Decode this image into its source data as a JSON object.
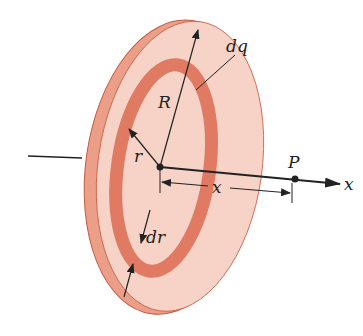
{
  "diagram": {
    "labels": {
      "charge_element": "dq",
      "disk_radius": "R",
      "ring_radius": "r",
      "point": "P",
      "axis": "x",
      "distance": "x",
      "ring_width": "dr"
    },
    "colors": {
      "disk_face": "#f6d3c6",
      "disk_rim": "#e8947e",
      "ring": "#e07a62",
      "outline": "#c9583f",
      "lines": "#222222"
    }
  }
}
